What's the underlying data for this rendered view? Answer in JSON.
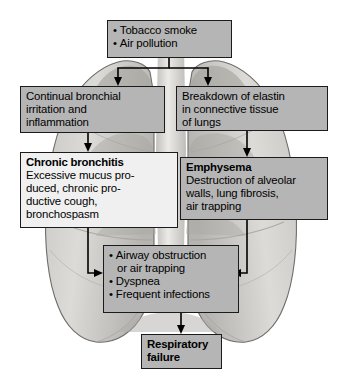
{
  "figure": {
    "background_illustration": "lungs-illustration",
    "colors": {
      "box_fill_gray": "#b5b5b5",
      "box_fill_light": "#f0f0f0",
      "border": "#1b1b1b",
      "text": "#000000",
      "arrow": "#000000",
      "lung_light": "#d4d2cf",
      "lung_mid": "#b9b7b3",
      "lung_dark": "#9a9894"
    }
  },
  "nodes": {
    "causes": {
      "name": "causes-box",
      "style": "gray",
      "lines": [
        "Tobacco smoke",
        "Air pollution"
      ]
    },
    "bronchial_irritation": {
      "name": "bronchial-irritation-box",
      "style": "gray",
      "lines": [
        "Continual bronchial",
        "irritation and",
        "inflammation"
      ]
    },
    "elastin_breakdown": {
      "name": "elastin-breakdown-box",
      "style": "gray",
      "lines": [
        "Breakdown of elastin",
        "in connective tissue",
        "of lungs"
      ]
    },
    "chronic_bronchitis": {
      "name": "chronic-bronchitis-box",
      "style": "light",
      "heading": "Chronic bronchitis",
      "lines": [
        "Excessive mucus pro-",
        "duced, chronic pro-",
        "ductive cough,",
        "bronchospasm"
      ]
    },
    "emphysema": {
      "name": "emphysema-box",
      "style": "gray",
      "heading": "Emphysema",
      "lines": [
        "Destruction of alveolar",
        "walls, lung fibrosis,",
        "air trapping"
      ]
    },
    "manifestations": {
      "name": "manifestations-box",
      "style": "gray",
      "lines": [
        "Airway obstruction",
        "or air trapping",
        "Dyspnea",
        "Frequent infections"
      ]
    },
    "respiratory_failure": {
      "name": "respiratory-failure-box",
      "style": "gray",
      "lines": [
        "Respiratory",
        "failure"
      ]
    }
  },
  "connectors": [
    {
      "name": "causes-to-bronchial-irritation",
      "from": "causes",
      "to": "bronchial_irritation"
    },
    {
      "name": "causes-to-elastin-breakdown",
      "from": "causes",
      "to": "elastin_breakdown"
    },
    {
      "name": "bronchial-irritation-to-chronic-bronchitis",
      "from": "bronchial_irritation",
      "to": "chronic_bronchitis"
    },
    {
      "name": "elastin-breakdown-to-emphysema",
      "from": "elastin_breakdown",
      "to": "emphysema"
    },
    {
      "name": "chronic-bronchitis-to-manifestations",
      "from": "chronic_bronchitis",
      "to": "manifestations"
    },
    {
      "name": "emphysema-to-manifestations",
      "from": "emphysema",
      "to": "manifestations"
    },
    {
      "name": "manifestations-to-respiratory-failure",
      "from": "manifestations",
      "to": "respiratory_failure"
    }
  ]
}
